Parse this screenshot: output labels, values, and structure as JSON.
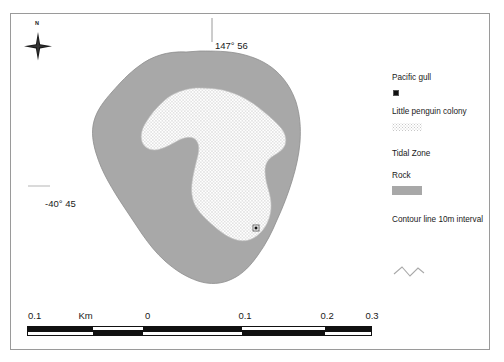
{
  "map": {
    "coordinates": {
      "longitude_label": "147° 56",
      "latitude_label": "-40° 45"
    },
    "compass": {
      "north_label": "N"
    },
    "colors": {
      "rock_fill": "#a8a8a8",
      "rock_outline": "#8f8f8f",
      "colony_fill": "#ffffff",
      "colony_stipple": "#b5b5b5",
      "gull_marker": "#111111",
      "frame_border": "#9a9a9a"
    },
    "features": {
      "pacific_gull_marker_label": "Pacific gull nest site",
      "rock_area_label": "Rock",
      "colony_area_label": "Little penguin colony"
    },
    "top_strip_text": ""
  },
  "legend": {
    "items": [
      {
        "label": "Pacific gull",
        "symbol": "point-marker"
      },
      {
        "label": "Little penguin colony",
        "symbol": "stipple-swatch"
      },
      {
        "label": "Tidal Zone",
        "symbol": "none"
      },
      {
        "label": "Rock",
        "symbol": "gray-swatch"
      },
      {
        "label": "Contour line 10m interval",
        "symbol": "wavy-line"
      }
    ]
  },
  "scale_bar": {
    "unit_label": "Km",
    "tick_labels": [
      "0.1",
      "0",
      "0.1",
      "0.2",
      "0.3"
    ],
    "tick_positions_pct": [
      2.2,
      35.0,
      63.2,
      87.0,
      100.0
    ],
    "unit_label_position_pct": 17.0,
    "segments_top": [
      {
        "start_pct": 2.2,
        "width_pct": 18.5,
        "fill": "black"
      },
      {
        "start_pct": 20.7,
        "width_pct": 14.3,
        "fill": "white"
      },
      {
        "start_pct": 35.0,
        "width_pct": 28.2,
        "fill": "black"
      },
      {
        "start_pct": 63.2,
        "width_pct": 23.8,
        "fill": "white"
      },
      {
        "start_pct": 87.0,
        "width_pct": 13.0,
        "fill": "black"
      }
    ],
    "segments_bottom": [
      {
        "start_pct": 2.2,
        "width_pct": 18.5,
        "fill": "white"
      },
      {
        "start_pct": 20.7,
        "width_pct": 14.3,
        "fill": "black"
      },
      {
        "start_pct": 35.0,
        "width_pct": 28.2,
        "fill": "white"
      },
      {
        "start_pct": 63.2,
        "width_pct": 23.8,
        "fill": "black"
      },
      {
        "start_pct": 87.0,
        "width_pct": 13.0,
        "fill": "white"
      }
    ]
  }
}
